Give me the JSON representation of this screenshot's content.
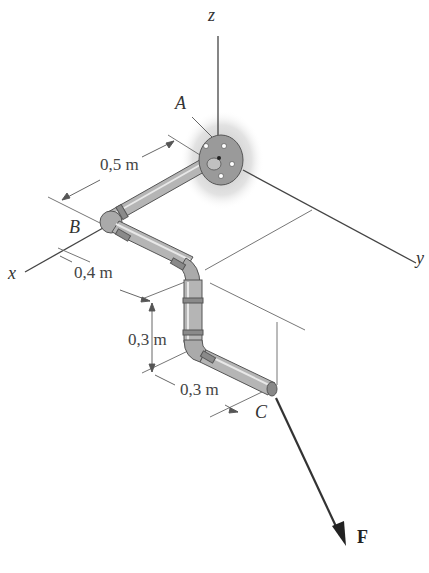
{
  "figure": {
    "type": "3D statics diagram: pipe assembly fixed at A with force F applied at C",
    "axes": {
      "x": "x",
      "y": "y",
      "z": "z"
    },
    "points": {
      "A": "A",
      "B": "B",
      "C": "C"
    },
    "force": {
      "label": "F"
    },
    "dimensions": {
      "AB": "0,5 m",
      "B_to_bend": "0,4 m",
      "vertical_drop": "0,3 m",
      "last_segment": "0,3 m"
    },
    "colors": {
      "lines": "#333333",
      "pipe": "#b8b8b8",
      "pipe_dark": "#7a7a7a",
      "shadow": "#c8c8c8",
      "background": "#ffffff"
    }
  }
}
